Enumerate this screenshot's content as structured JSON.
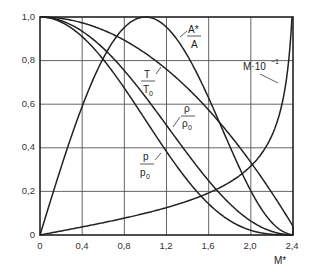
{
  "chart_data": {
    "type": "line",
    "title": "",
    "xlabel": "M*",
    "ylabel": "",
    "xlim": [
      0,
      2.4
    ],
    "ylim": [
      0,
      1.0
    ],
    "grid": true,
    "legend_position": "inline annotations",
    "x_ticks": [
      "0",
      "0,4",
      "0,8",
      "1,2",
      "1,6",
      "2,0",
      "2,4"
    ],
    "y_ticks": [
      "0",
      "0,2",
      "0,4",
      "0,6",
      "0,8",
      "1,0"
    ],
    "x": [
      0,
      0.2,
      0.4,
      0.6,
      0.8,
      1.0,
      1.2,
      1.4,
      1.6,
      1.8,
      2.0,
      2.2,
      2.4
    ],
    "series": [
      {
        "name": "T/T0",
        "values": [
          1.0,
          0.993,
          0.973,
          0.94,
          0.893,
          0.833,
          0.76,
          0.673,
          0.573,
          0.46,
          0.333,
          0.193,
          0.04
        ]
      },
      {
        "name": "rho/rho0",
        "values": [
          1.0,
          0.983,
          0.934,
          0.856,
          0.753,
          0.634,
          0.504,
          0.372,
          0.249,
          0.144,
          0.064,
          0.016,
          0.0
        ]
      },
      {
        "name": "p/p0",
        "values": [
          1.0,
          0.977,
          0.909,
          0.804,
          0.673,
          0.528,
          0.383,
          0.251,
          0.143,
          0.066,
          0.021,
          0.003,
          0.0
        ]
      },
      {
        "name": "A*/A",
        "values": [
          0.0,
          0.295,
          0.56,
          0.768,
          0.91,
          1.0,
          0.96,
          0.823,
          0.627,
          0.411,
          0.213,
          0.07,
          0.003
        ]
      },
      {
        "name": "M·10^-1",
        "values": [
          0.0,
          0.018,
          0.037,
          0.057,
          0.079,
          0.1,
          0.124,
          0.153,
          0.19,
          0.241,
          0.316,
          0.446,
          0.824
        ]
      }
    ],
    "annotations": [
      {
        "text": "A*/A",
        "num": "A*",
        "den": "A"
      },
      {
        "text": "T/T0",
        "num": "T",
        "den": "T",
        "den_sub": "0"
      },
      {
        "text": "rho/rho0",
        "num": "ρ",
        "den": "ρ",
        "den_sub": "0"
      },
      {
        "text": "p/p0",
        "num": "p",
        "den": "p",
        "den_sub": "0"
      },
      {
        "text": "M·10^-1",
        "base": "M·10",
        "sup": "−1"
      }
    ]
  },
  "labels": {
    "xlabel": "M*",
    "astar_num": "A*",
    "astar_den": "A",
    "t_num": "T",
    "t_den": "T",
    "t_sub": "0",
    "rho_num": "ρ",
    "rho_den": "ρ",
    "rho_sub": "0",
    "p_num": "p",
    "p_den": "p",
    "p_sub": "0",
    "mach_base": "M·10",
    "mach_sup": "−1"
  },
  "ticks": {
    "x": [
      "0",
      "0,4",
      "0,8",
      "1,2",
      "1,6",
      "2,0",
      "2,4"
    ],
    "y": [
      "0",
      "0,2",
      "0,4",
      "0,6",
      "0,8",
      "1,0"
    ]
  },
  "colors": {
    "line": "#222222",
    "grid": "#555555",
    "background": "#ffffff"
  }
}
